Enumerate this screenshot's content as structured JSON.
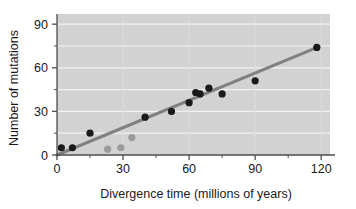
{
  "chart_data": {
    "type": "scatter",
    "title": "",
    "subtitle": "",
    "xlabel": "Divergence time (millions of years)",
    "ylabel": "Number of mutations",
    "xlim": [
      0,
      124
    ],
    "ylim": [
      0,
      97
    ],
    "xticks": [
      0,
      30,
      60,
      90,
      120
    ],
    "xtick_labels": [
      "0",
      "30",
      "60",
      "90",
      "120"
    ],
    "x_minor_ticks": [
      15,
      45,
      75,
      105
    ],
    "yticks": [
      0,
      30,
      60,
      90
    ],
    "ytick_labels": [
      "0",
      "30",
      "60",
      "90"
    ],
    "y_minor_ticks": [
      15,
      45,
      75
    ],
    "grid": "horizontal-white-on-gray",
    "legend": "none",
    "plot_bg_color": "#d2d2d2",
    "grid_color": "#f2f2f2",
    "axis_color": "#4d4d4d",
    "series": [
      {
        "name": "primary-data-points",
        "marker": "filled-circle",
        "color": "#1a1a1a",
        "points": [
          {
            "x": 2,
            "y": 5
          },
          {
            "x": 7,
            "y": 5
          },
          {
            "x": 15,
            "y": 15
          },
          {
            "x": 40,
            "y": 26
          },
          {
            "x": 52,
            "y": 30
          },
          {
            "x": 60,
            "y": 36
          },
          {
            "x": 63,
            "y": 43
          },
          {
            "x": 65,
            "y": 42
          },
          {
            "x": 69,
            "y": 46
          },
          {
            "x": 75,
            "y": 42
          },
          {
            "x": 90,
            "y": 51
          },
          {
            "x": 118,
            "y": 74
          }
        ]
      },
      {
        "name": "secondary-data-points",
        "marker": "filled-circle",
        "color": "#9a9a9a",
        "points": [
          {
            "x": 23,
            "y": 4
          },
          {
            "x": 29,
            "y": 5
          },
          {
            "x": 34,
            "y": 12
          }
        ]
      }
    ],
    "trendline": {
      "name": "regression-line",
      "color": "#808080",
      "width": 3,
      "x0": 0,
      "y0": 0,
      "x1": 119,
      "y1": 74.5
    }
  }
}
